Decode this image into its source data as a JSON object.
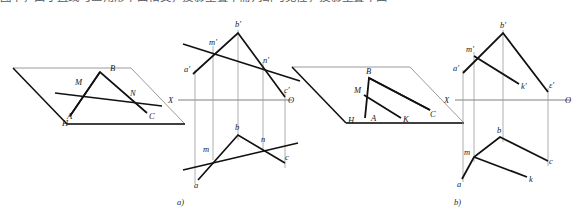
{
  "figure": {
    "top_text_fragment": "图中，由于直线与三角形平面相交，投影重叠中需判断可见性，投影重叠中面",
    "background_color": "#ffffff",
    "line_color": "#111111",
    "thin_line_color": "#8a8a8a",
    "axis_color": "#6f6f6f",
    "captions": [
      {
        "id": "caption-a",
        "label": "a)"
      },
      {
        "id": "caption-b",
        "label": "b)"
      }
    ]
  },
  "panel_a": {
    "name": "panel-a",
    "caption": "a)",
    "pictorial": {
      "name": "pictorial-plane-a",
      "plane_label": "H",
      "labels": [
        {
          "key": "A",
          "text": "A",
          "x": 67,
          "y": 119
        },
        {
          "key": "B",
          "text": "B",
          "x": 110,
          "y": 71
        },
        {
          "key": "C",
          "text": "C",
          "x": 149,
          "y": 119
        },
        {
          "key": "M",
          "text": "M",
          "x": 78,
          "y": 85
        },
        {
          "key": "N",
          "text": "N",
          "x": 132,
          "y": 96
        },
        {
          "key": "H",
          "text": "H",
          "x": 64,
          "y": 125
        }
      ]
    },
    "projection": {
      "name": "projection-a",
      "axis_left_label": "X",
      "axis_right_label": "O",
      "upper_labels": [
        {
          "key": "a_prime",
          "text": "a'",
          "x": 186,
          "y": 70
        },
        {
          "key": "m_prime",
          "text": "m'",
          "x": 212,
          "y": 42
        },
        {
          "key": "b_prime",
          "text": "b'",
          "x": 235,
          "y": 24
        },
        {
          "key": "n_prime",
          "text": "n'",
          "x": 265,
          "y": 60
        },
        {
          "key": "c_prime",
          "text": "c'",
          "x": 281,
          "y": 90
        }
      ],
      "lower_labels": [
        {
          "key": "a",
          "text": "a",
          "x": 197,
          "y": 185
        },
        {
          "key": "m",
          "text": "m",
          "x": 205,
          "y": 148
        },
        {
          "key": "b",
          "text": "b",
          "x": 237,
          "y": 128
        },
        {
          "key": "n",
          "text": "n",
          "x": 265,
          "y": 141
        },
        {
          "key": "c",
          "text": "c",
          "x": 285,
          "y": 158
        }
      ]
    }
  },
  "panel_b": {
    "name": "panel-b",
    "caption": "b)",
    "pictorial": {
      "name": "pictorial-plane-b",
      "plane_label": "H",
      "labels": [
        {
          "key": "A",
          "text": "A",
          "x": 373,
          "y": 120
        },
        {
          "key": "B",
          "text": "B",
          "x": 366,
          "y": 73
        },
        {
          "key": "C",
          "text": "C",
          "x": 431,
          "y": 117
        },
        {
          "key": "M",
          "text": "M",
          "x": 357,
          "y": 92
        },
        {
          "key": "K",
          "text": "K",
          "x": 405,
          "y": 121
        },
        {
          "key": "H",
          "text": "H",
          "x": 350,
          "y": 122
        }
      ]
    },
    "projection": {
      "name": "projection-b",
      "axis_left_label": "X",
      "axis_right_label": "O",
      "upper_labels": [
        {
          "key": "a_prime",
          "text": "a'",
          "x": 456,
          "y": 68
        },
        {
          "key": "m_prime",
          "text": "m'",
          "x": 468,
          "y": 48
        },
        {
          "key": "b_prime",
          "text": "b'",
          "x": 500,
          "y": 25
        },
        {
          "key": "k_prime",
          "text": "k'",
          "x": 518,
          "y": 86
        },
        {
          "key": "c_prime",
          "text": "ε'",
          "x": 551,
          "y": 85
        }
      ],
      "lower_labels": [
        {
          "key": "a",
          "text": "a",
          "x": 456,
          "y": 184
        },
        {
          "key": "m",
          "text": "m",
          "x": 466,
          "y": 150
        },
        {
          "key": "b",
          "text": "b",
          "x": 497,
          "y": 129
        },
        {
          "key": "k",
          "text": "k",
          "x": 527,
          "y": 180
        },
        {
          "key": "c",
          "text": "c",
          "x": 546,
          "y": 155
        }
      ]
    }
  },
  "geometry_a": {
    "plane_outline": "13,68 131,68 185,124 67,124",
    "triangle": "72,79 100,72 147,113",
    "line_mn": "55,93 160,104",
    "seg_ma": "80,74 70,115",
    "proj_axis_y": 100,
    "proj_axis_x1": 178,
    "proj_axis_x2": 292,
    "upper": {
      "a_prime": "193,74",
      "m_prime": "213,51",
      "b_prime": "238,33",
      "n_prime": "263,69",
      "c_prime": "285,97"
    },
    "lower": {
      "a": "198,180",
      "m": "212,155",
      "b": "238,135",
      "n": "263,147",
      "c": "285,163"
    },
    "line_upper_ext": "183,45 295,80",
    "line_lower_ext": "183,170 295,143"
  },
  "geometry_b": {
    "plane_outline": "292,67 410,67 464,123 346,123",
    "triangle": "365,117 368,80 430,110",
    "seg_mk": "364,96 400,117",
    "proj_axis_y": 100,
    "proj_axis_x1": 455,
    "proj_axis_x2": 570,
    "upper": {
      "a_prime": "463,73",
      "m_prime": "474,56",
      "b_prime": "503,33",
      "k_prime": "516,80",
      "c_prime": "548,92"
    },
    "lower": {
      "a": "462,179",
      "m": "474,157",
      "b": "500,137",
      "k": "524,175",
      "c": "548,161"
    }
  }
}
